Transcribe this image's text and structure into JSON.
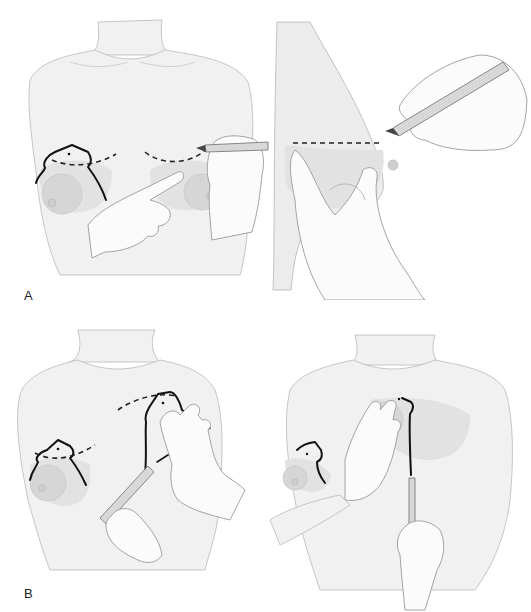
{
  "figure": {
    "panels": [
      {
        "id": "A-front",
        "description": "Front view: inframammary fold marking on both breasts with keyhole pattern drawn on right breast; gloved hand points to fold while other hand draws dashed line with marker pen"
      },
      {
        "id": "A-side",
        "description": "Lateral view: breast lifted by hand, dashed line marked at level of inframammary fold with marker pen"
      },
      {
        "id": "B-left",
        "description": "Front view: keyhole/Wise pattern marked on both breasts, hand displaces left breast while pen marks vertical limb"
      },
      {
        "id": "B-right",
        "description": "Front view: hand displaces breast medially while pen marks vertical limb line downward"
      }
    ],
    "labels": {
      "a": "A",
      "b": "B"
    }
  }
}
